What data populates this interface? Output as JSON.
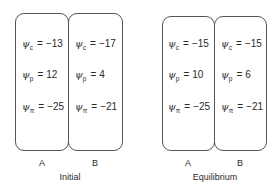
{
  "diagram": {
    "symbol": "ψ",
    "equals": "=",
    "panels": [
      {
        "title": "Initial",
        "cells": [
          {
            "label": "A",
            "rows": [
              {
                "sub": "c",
                "value": "−13"
              },
              {
                "sub": "p",
                "value": "12"
              },
              {
                "sub": "π",
                "value": "−25"
              }
            ]
          },
          {
            "label": "B",
            "rows": [
              {
                "sub": "c",
                "value": "−17"
              },
              {
                "sub": "p",
                "value": "4"
              },
              {
                "sub": "π",
                "value": "−21"
              }
            ]
          }
        ]
      },
      {
        "title": "Equilibrium",
        "cells": [
          {
            "label": "A",
            "rows": [
              {
                "sub": "c",
                "value": "−15"
              },
              {
                "sub": "p",
                "value": "10"
              },
              {
                "sub": "π",
                "value": "−25"
              }
            ]
          },
          {
            "label": "B",
            "rows": [
              {
                "sub": "c",
                "value": "−15"
              },
              {
                "sub": "p",
                "value": "6"
              },
              {
                "sub": "π",
                "value": "−21"
              }
            ]
          }
        ]
      }
    ]
  }
}
